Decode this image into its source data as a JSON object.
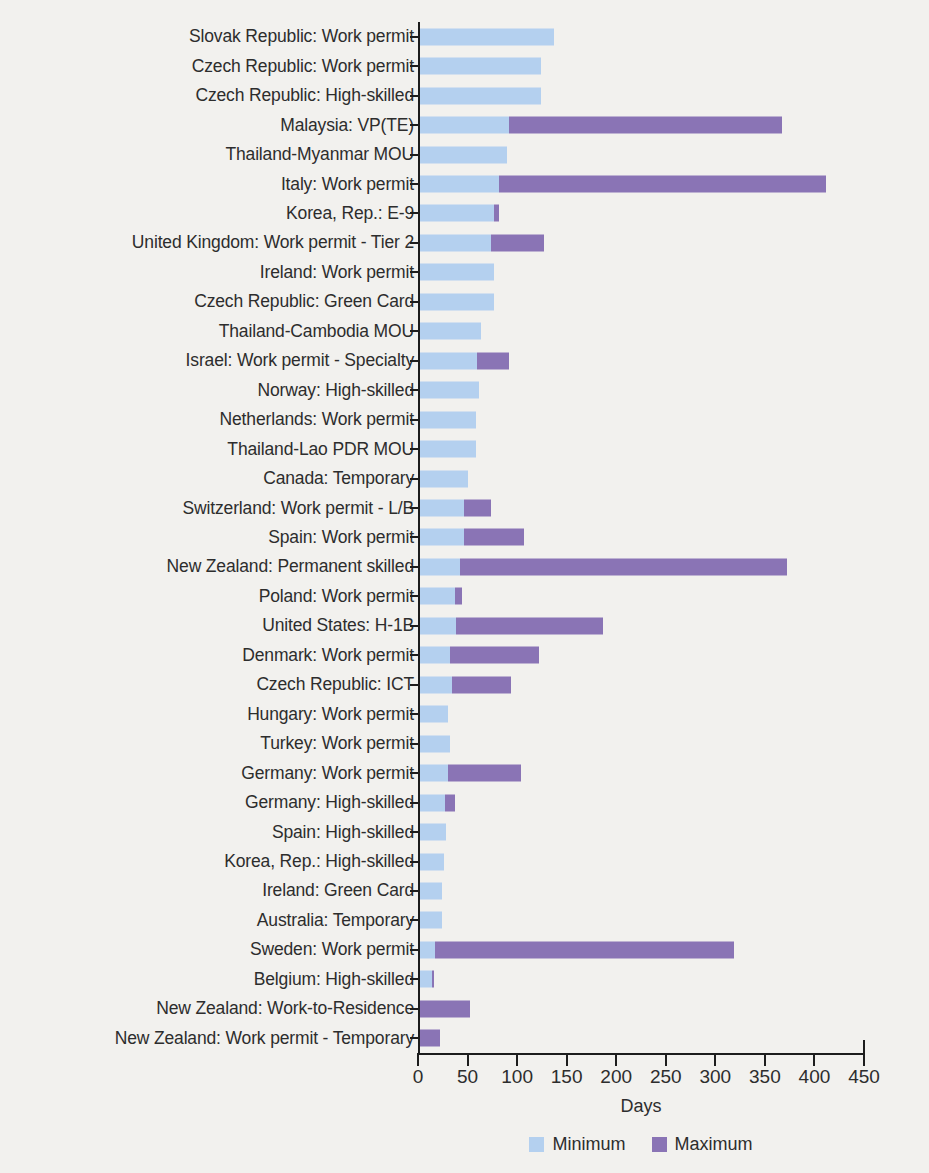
{
  "chart_data": {
    "type": "bar",
    "orientation": "horizontal",
    "title": "",
    "xlabel": "Days",
    "ylabel": "",
    "xlim": [
      0,
      450
    ],
    "xticks": [
      0,
      50,
      100,
      150,
      200,
      250,
      300,
      350,
      400,
      450
    ],
    "grid": false,
    "legend_position": "bottom",
    "colors": {
      "minimum": "#b4d0ef",
      "maximum": "#8a74b5"
    },
    "legend": [
      "Minimum",
      "Maximum"
    ],
    "categories": [
      "Slovak Republic: Work permit",
      "Czech Republic: Work permit",
      "Czech Republic: High-skilled",
      "Malaysia: VP(TE)",
      "Thailand-Myanmar MOU",
      "Italy: Work permit",
      "Korea, Rep.: E-9",
      "United Kingdom: Work permit - Tier 2",
      "Ireland: Work permit",
      "Czech Republic: Green Card",
      "Thailand-Cambodia MOU",
      "Israel: Work permit - Specialty",
      "Norway: High-skilled",
      "Netherlands: Work permit",
      "Thailand-Lao PDR MOU",
      "Canada: Temporary",
      "Switzerland: Work permit - L/B",
      "Spain: Work permit",
      "New Zealand: Permanent skilled",
      "Poland: Work permit",
      "United States: H-1B",
      "Denmark: Work permit",
      "Czech Republic: ICT",
      "Hungary: Work permit",
      "Turkey: Work permit",
      "Germany: Work permit",
      "Germany: High-skilled",
      "Spain: High-skilled",
      "Korea, Rep.: High-skilled",
      "Ireland: Green Card",
      "Australia: Temporary",
      "Sweden: Work permit",
      "Belgium: High-skilled",
      "New Zealand: Work-to-Residence",
      "New Zealand: Work permit - Temporary"
    ],
    "series": [
      {
        "name": "Minimum",
        "values": [
          135,
          122,
          122,
          90,
          88,
          80,
          75,
          72,
          75,
          75,
          62,
          58,
          60,
          56,
          56,
          48,
          44,
          44,
          40,
          35,
          36,
          30,
          32,
          28,
          30,
          28,
          25,
          26,
          24,
          22,
          22,
          15,
          12,
          0,
          0
        ]
      },
      {
        "name": "Maximum",
        "values": [
          135,
          122,
          122,
          365,
          88,
          410,
          80,
          125,
          75,
          75,
          62,
          90,
          60,
          56,
          56,
          48,
          72,
          105,
          370,
          42,
          185,
          120,
          92,
          28,
          30,
          102,
          35,
          26,
          24,
          22,
          22,
          317,
          14,
          50,
          20
        ]
      }
    ]
  }
}
